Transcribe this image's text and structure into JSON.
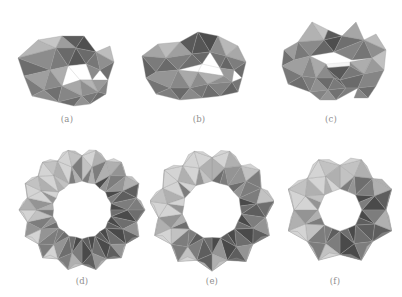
{
  "figure": {
    "background_color": "#ffffff",
    "caption_color": "#8e8e8e",
    "render_style": "grayscale shaded triangulated polyhedra, thin light-gray edges, white background",
    "palette": {
      "darkest": "#4a4a4a",
      "dark": "#5e5e5e",
      "mid_dark": "#6e6e6e",
      "mid": "#7d7d7d",
      "mid_light": "#949494",
      "light": "#b0b0b0",
      "lighter": "#c2c2c2",
      "highlight": "#d4d4d4",
      "edge": "#9a9a9a",
      "hole": "#ffffff"
    },
    "rows": 2,
    "columns": 3,
    "panels": [
      {
        "id": "a",
        "caption": "(a)",
        "description": "small open loop of face-joined polyhedra seen obliquely, single small central opening",
        "unit_count": 6,
        "shape": "open oblique ring",
        "center_x": 70,
        "center_y": 63,
        "caption_x": 67,
        "caption_y": 118
      },
      {
        "id": "b",
        "caption": "(b)",
        "description": "wide flattened ring of face-joined polyhedra viewed nearly edge-on, narrow slit opening",
        "unit_count": 7,
        "shape": "flattened wide ring",
        "center_x": 200,
        "center_y": 62,
        "caption_x": 199,
        "caption_y": 118
      },
      {
        "id": "c",
        "caption": "(c)",
        "description": "compact double-lobed cluster of polyhedra with a thin horizontal gap near the middle",
        "unit_count": 7,
        "shape": "compact cluster",
        "center_x": 334,
        "center_y": 60,
        "caption_x": 331,
        "caption_y": 118
      },
      {
        "id": "d",
        "caption": "(d)",
        "description": "large circular torus ring of icosahedra around a wide white circular hole",
        "unit_count": 14,
        "shape": "circular torus ring",
        "center_x": 82,
        "center_y": 207,
        "caption_x": 82,
        "caption_y": 281
      },
      {
        "id": "e",
        "caption": "(e)",
        "description": "star-like polygonal ring of octahedra around a round white hole",
        "unit_count": 11,
        "shape": "star polygon ring",
        "center_x": 212,
        "center_y": 208,
        "caption_x": 212,
        "caption_y": 281
      },
      {
        "id": "f",
        "caption": "(f)",
        "description": "smaller octagonal ring of polyhedra around a hexagonal white hole",
        "unit_count": 8,
        "shape": "octagonal ring",
        "center_x": 337,
        "center_y": 210,
        "caption_x": 335,
        "caption_y": 281
      }
    ]
  }
}
